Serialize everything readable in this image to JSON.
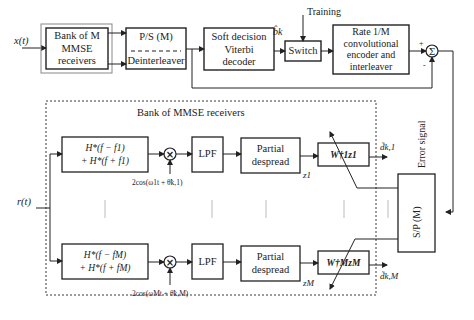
{
  "diagram": {
    "top_row": {
      "input_label": "x(t)",
      "bank_box": {
        "line1": "Bank of M",
        "line2": "MMSE",
        "line3": "receivers"
      },
      "ps_box": {
        "top": "P/S (M)",
        "bottom": "Deinterleaver"
      },
      "viterbi_box": {
        "line1": "Soft decision",
        "line2": "Viterbi",
        "line3": "decoder"
      },
      "bk_label": "b̂k",
      "training_label": "Training",
      "switch_box": "Switch",
      "encoder_box": {
        "line1": "Rate 1/M",
        "line2": "convolutional",
        "line3": "encoder and",
        "line4": "interleaver"
      },
      "sum_symbol": "Σ",
      "plus_sign": "+",
      "minus_sign": "-"
    },
    "error_signal_label": "Error signal",
    "sp_box": "S/P (M)",
    "bank_detail": {
      "title": "Bank of MMSE receivers",
      "input_label": "r(t)",
      "branches": [
        {
          "filter_line1": "H*(f − f1)",
          "filter_line2": "+ H*(f + f1)",
          "mixer_symbol": "×",
          "oscillator": "2cos(ω1t + θ̃k,1)",
          "lpf": "LPF",
          "despread_line1": "Partial",
          "despread_line2": "despread",
          "z_label": "z1",
          "weight": "W†1z1",
          "output": "d̃k,1"
        },
        {
          "filter_line1": "H*(f − fM)",
          "filter_line2": "+ H*(f + fM)",
          "mixer_symbol": "×",
          "oscillator": "2cos(ωMt + θ̃k,M)",
          "lpf": "LPF",
          "despread_line1": "Partial",
          "despread_line2": "despread",
          "z_label": "zM",
          "weight": "W†MzM",
          "output": "d̃k,M"
        }
      ]
    }
  }
}
